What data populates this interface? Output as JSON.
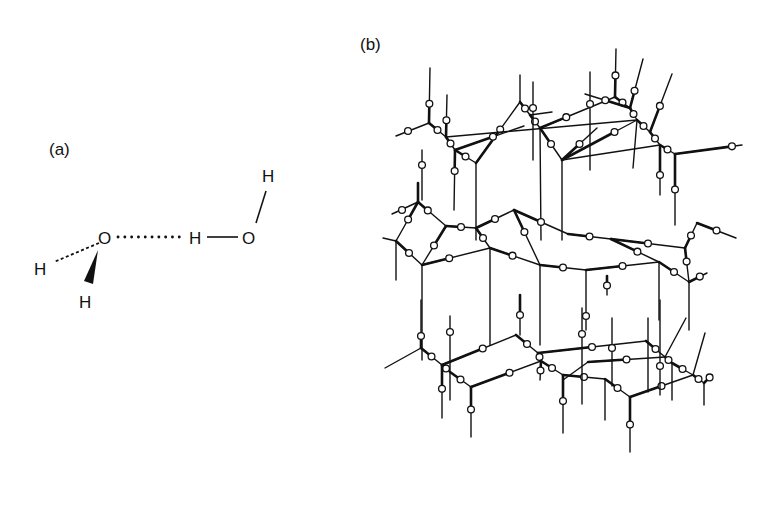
{
  "figure": {
    "panel_a": {
      "label": "(a)",
      "atoms": [
        {
          "id": "O1",
          "symbol": "O",
          "x": 107,
          "y": 238
        },
        {
          "id": "H1a",
          "symbol": "H",
          "x": 41,
          "y": 269
        },
        {
          "id": "H1b",
          "symbol": "H",
          "x": 86,
          "y": 301
        },
        {
          "id": "H2a",
          "symbol": "H",
          "x": 196,
          "y": 238
        },
        {
          "id": "O2",
          "symbol": "O",
          "x": 251,
          "y": 238
        },
        {
          "id": "H2b",
          "symbol": "H",
          "x": 268,
          "y": 177
        }
      ],
      "bonds": [
        {
          "from": "O1",
          "to": "H1a",
          "style": "dashed-wedge"
        },
        {
          "from": "O1",
          "to": "H1b",
          "style": "solid-wedge"
        },
        {
          "from": "O1",
          "to": "H2a",
          "style": "hydrogen-bond-dotted"
        },
        {
          "from": "H2a",
          "to": "O2",
          "style": "single"
        },
        {
          "from": "O2",
          "to": "H2b",
          "style": "single"
        }
      ],
      "caption_semantic": "water dimer hydrogen bond"
    },
    "panel_b": {
      "label": "(b)",
      "caption_semantic": "hexagonal ice (Ih) lattice",
      "legend": {
        "oxygen": "bold ring",
        "hydrogen": "small open circle"
      }
    }
  }
}
